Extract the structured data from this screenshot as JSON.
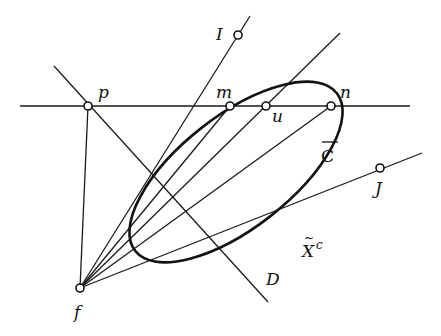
{
  "diagram": {
    "type": "projective-geometry-figure",
    "labels": {
      "I": "I",
      "p": "p",
      "m": "m",
      "u": "u",
      "n": "n",
      "C": "C",
      "J": "J",
      "X": "X",
      "X_sup": "c",
      "D": "D",
      "f": "f"
    },
    "points": [
      {
        "name": "I",
        "x": 238,
        "y": 35
      },
      {
        "name": "p",
        "x": 88,
        "y": 106
      },
      {
        "name": "m",
        "x": 230,
        "y": 106
      },
      {
        "name": "u",
        "x": 266,
        "y": 106
      },
      {
        "name": "n",
        "x": 331,
        "y": 106
      },
      {
        "name": "J",
        "x": 380,
        "y": 168
      },
      {
        "name": "f",
        "x": 80,
        "y": 288
      }
    ],
    "curve_label": "C-bar (ellipse)",
    "region_label": "X-tilde superscript c"
  }
}
